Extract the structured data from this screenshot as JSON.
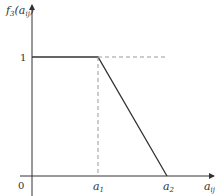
{
  "diagram": {
    "y_axis_label": "f",
    "y_axis_label_sub": "3",
    "y_axis_label_arg": "(a",
    "y_axis_label_arg_sub": "ij",
    "y_axis_label_close": ")",
    "x_axis_label": "a",
    "x_axis_label_sub": "ij",
    "origin_label": "0",
    "y_tick_label": "1",
    "x_ticks": [
      {
        "label": "a",
        "sub": "1"
      },
      {
        "label": "a",
        "sub": "2"
      }
    ],
    "colors": {
      "line": "#333333",
      "dashed": "#999999",
      "text": "#333333"
    }
  }
}
